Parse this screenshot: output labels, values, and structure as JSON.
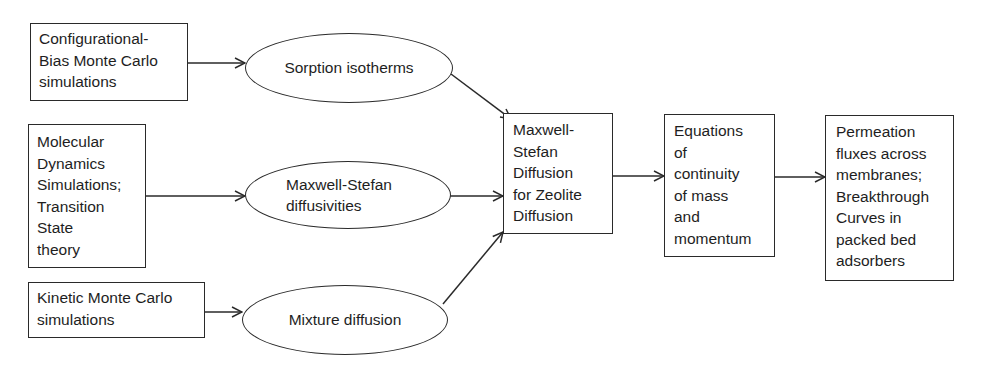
{
  "diagram": {
    "sources": [
      {
        "id": "cbmc",
        "label": "Configurational-\nBias Monte Carlo\nsimulations"
      },
      {
        "id": "md",
        "label": "Molecular\nDynamics\nSimulations;\nTransition\nState\ntheory"
      },
      {
        "id": "kmc",
        "label": "Kinetic Monte Carlo\nsimulations"
      }
    ],
    "properties": [
      {
        "id": "sorption",
        "label": "Sorption isotherms"
      },
      {
        "id": "ms_diff",
        "label": "Maxwell-Stefan\ndiffusivities"
      },
      {
        "id": "mixture",
        "label": "Mixture diffusion"
      }
    ],
    "core": {
      "id": "ms_zeolite",
      "label": "Maxwell-\nStefan\nDiffusion\nfor Zeolite\nDiffusion"
    },
    "equations": {
      "id": "continuity",
      "label": "Equations\nof\ncontinuity\nof mass\nand\nmomentum"
    },
    "outputs": {
      "id": "permeation",
      "label": "Permeation\nfluxes across\nmembranes;\nBreakthrough\nCurves in\npacked bed\nadsorbers"
    },
    "edges": [
      {
        "from": "cbmc",
        "to": "sorption"
      },
      {
        "from": "md",
        "to": "ms_diff"
      },
      {
        "from": "kmc",
        "to": "mixture"
      },
      {
        "from": "sorption",
        "to": "ms_zeolite"
      },
      {
        "from": "ms_diff",
        "to": "ms_zeolite"
      },
      {
        "from": "mixture",
        "to": "ms_zeolite"
      },
      {
        "from": "ms_zeolite",
        "to": "continuity"
      },
      {
        "from": "continuity",
        "to": "permeation"
      }
    ]
  }
}
